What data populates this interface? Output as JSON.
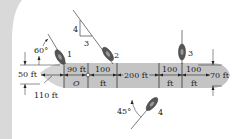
{
  "figure": {
    "colors": {
      "side_panel": "#d9d9d9",
      "barge_fill": "#c4c4c4",
      "barge_tip": "#d4d4d4",
      "line": "#222222",
      "boat_body": "#555555",
      "boat_outline": "#333333",
      "background": "#ffffff"
    },
    "dimensions": {
      "left_height": "50 ft",
      "right_height": "70 ft",
      "tip_length": "110 ft",
      "seg_90": "90 ft",
      "seg_100_a_top": "100",
      "seg_100_a_bot": "ft",
      "seg_200": "200 ft",
      "seg_100_b_top": "100",
      "seg_100_b_bot": "ft",
      "seg_100_c_top": "100",
      "seg_100_c_bot": "ft"
    },
    "point_label": "O",
    "slope": {
      "rise": "4",
      "run": "3"
    },
    "angles": {
      "tug1": "60°",
      "tug4": "45°"
    },
    "tugs": [
      {
        "label": "1"
      },
      {
        "label": "2"
      },
      {
        "label": "3"
      },
      {
        "label": "4"
      }
    ]
  }
}
